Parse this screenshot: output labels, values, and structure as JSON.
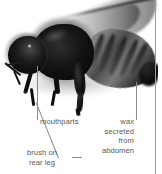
{
  "figure": {
    "background_color": "#ffffff",
    "caption_color": "#58595b",
    "leader_color": "#8a8a8a",
    "rule_color": "#9b9b9b"
  },
  "labels": {
    "mouthparts": "mouthparts",
    "brush_line1": "brush on",
    "brush_line2": "rear leg",
    "wax_line1": "wax",
    "wax_line2": "secreted",
    "wax_line3": "from",
    "wax_line4": "abdomen"
  }
}
